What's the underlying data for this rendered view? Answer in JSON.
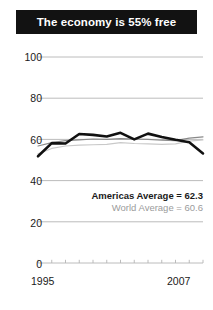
{
  "chart_data": {
    "type": "line",
    "title": "The economy is 55% free",
    "xlabel": "",
    "ylabel": "",
    "xlim": [
      1995,
      2007
    ],
    "ylim": [
      0,
      100
    ],
    "yticks": [
      0,
      20,
      40,
      60,
      80,
      100
    ],
    "xticks": [
      1995,
      1996,
      1997,
      1998,
      1999,
      2000,
      2001,
      2002,
      2003,
      2004,
      2005,
      2006,
      2007
    ],
    "xtick_labels_shown": [
      "1995",
      "2007"
    ],
    "grid": "horizontal",
    "legend_position": "inside-lower-right",
    "x": [
      1995,
      1996,
      1997,
      1998,
      1999,
      2000,
      2001,
      2002,
      2003,
      2004,
      2005,
      2006,
      2007
    ],
    "series": [
      {
        "name": "Country",
        "label": "Country",
        "color": "#111111",
        "width": 2.6,
        "values": [
          51.8,
          58.2,
          58.0,
          62.6,
          62.2,
          61.4,
          63.2,
          60.0,
          62.8,
          61.2,
          59.8,
          58.6,
          53.2
        ]
      },
      {
        "name": "Americas Average",
        "label": "Americas Average = 62.3",
        "color": "#8a8a8a",
        "width": 1.2,
        "values": [
          56.8,
          58.4,
          59.4,
          59.8,
          60.2,
          60.0,
          60.4,
          60.2,
          60.0,
          59.6,
          59.4,
          60.6,
          61.2
        ]
      },
      {
        "name": "World Average",
        "label": "World Average = 60.6",
        "color": "#c9c9c9",
        "width": 1.2,
        "values": [
          53.0,
          55.6,
          56.8,
          57.2,
          57.4,
          57.6,
          58.4,
          58.0,
          57.8,
          57.6,
          57.8,
          59.2,
          59.8
        ]
      }
    ],
    "annotations": [
      {
        "name": "americas-average",
        "text": "Americas Average = 62.3",
        "value": 62.3,
        "color": "#1a1a1a"
      },
      {
        "name": "world-average",
        "text": "World Average = 60.6",
        "value": 60.6,
        "color": "#9b9b9b"
      }
    ],
    "axis_color": "#b4b4b4",
    "grid_color": "#b4b4b4",
    "background": "#ffffff"
  },
  "labels": {
    "y": [
      "100",
      "80",
      "60",
      "40",
      "20",
      "0"
    ],
    "x_left": "1995",
    "x_right": "2007"
  },
  "legend": {
    "americas": "Americas Average = 62.3",
    "world": "World Average = 60.6"
  }
}
